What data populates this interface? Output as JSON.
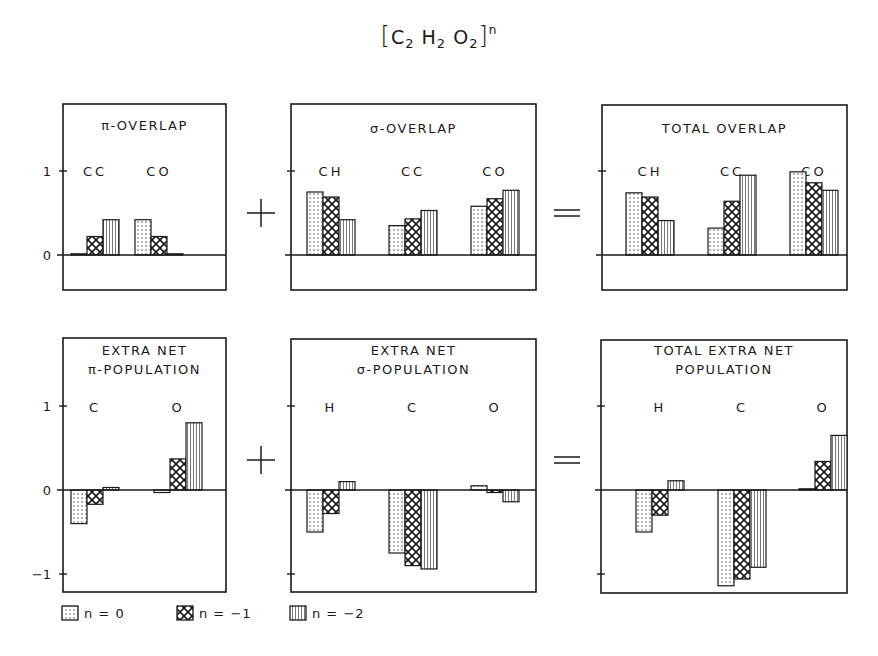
{
  "figure": {
    "title": {
      "open_bracket": "[",
      "parts": [
        {
          "symbol": "C",
          "subscript": "2"
        },
        {
          "symbol": "H",
          "subscript": "2"
        },
        {
          "symbol": "O",
          "subscript": "2"
        }
      ],
      "close_bracket": "]",
      "superscript": "n"
    },
    "operators": {
      "plus": "+",
      "equals": "="
    },
    "colors": {
      "ink": "#1a1a1a",
      "background": "#ffffff"
    }
  },
  "legend": {
    "items": [
      {
        "label": "n = 0",
        "pattern": "dots"
      },
      {
        "label": "n = −1",
        "pattern": "crosshatch"
      },
      {
        "label": "n = −2",
        "pattern": "vertical-lines"
      }
    ]
  },
  "chart_data": [
    {
      "type": "bar",
      "panel": "top-left",
      "title": [
        "π-OVERLAP"
      ],
      "categories": [
        "CC",
        "CO"
      ],
      "series": [
        {
          "name": "n = 0",
          "values": [
            0.01,
            0.42
          ]
        },
        {
          "name": "n = -1",
          "values": [
            0.22,
            0.22
          ]
        },
        {
          "name": "n = -2",
          "values": [
            0.42,
            0.01
          ]
        }
      ],
      "yticks": [
        0,
        1
      ],
      "ytick_labels": [
        "0",
        "1"
      ],
      "ylim": [
        -0.42,
        1.8
      ],
      "xlabel": "",
      "ylabel": "",
      "grid": false
    },
    {
      "type": "bar",
      "panel": "top-middle",
      "title": [
        "σ-OVERLAP"
      ],
      "categories": [
        "CH",
        "CC",
        "CO"
      ],
      "series": [
        {
          "name": "n = 0",
          "values": [
            0.75,
            0.35,
            0.58
          ]
        },
        {
          "name": "n = -1",
          "values": [
            0.69,
            0.43,
            0.67
          ]
        },
        {
          "name": "n = -2",
          "values": [
            0.42,
            0.53,
            0.77
          ]
        }
      ],
      "yticks": [
        0,
        1
      ],
      "ytick_labels": [],
      "ylim": [
        -0.42,
        1.8
      ],
      "xlabel": "",
      "ylabel": "",
      "grid": false
    },
    {
      "type": "bar",
      "panel": "top-right",
      "title": [
        "TOTAL OVERLAP"
      ],
      "categories": [
        "CH",
        "CC",
        "CO"
      ],
      "series": [
        {
          "name": "n = 0",
          "values": [
            0.74,
            0.32,
            0.99
          ]
        },
        {
          "name": "n = -1",
          "values": [
            0.69,
            0.64,
            0.86
          ]
        },
        {
          "name": "n = -2",
          "values": [
            0.41,
            0.95,
            0.77
          ]
        }
      ],
      "yticks": [
        0,
        1
      ],
      "ytick_labels": [],
      "ylim": [
        -0.42,
        1.8
      ],
      "xlabel": "",
      "ylabel": "",
      "grid": false
    },
    {
      "type": "bar",
      "panel": "bottom-left",
      "title": [
        "EXTRA NET",
        "π-POPULATION"
      ],
      "categories": [
        "C",
        "O"
      ],
      "series": [
        {
          "name": "n = 0",
          "values": [
            -0.4,
            -0.03
          ]
        },
        {
          "name": "n = -1",
          "values": [
            -0.17,
            0.37
          ]
        },
        {
          "name": "n = -2",
          "values": [
            0.03,
            0.8
          ]
        }
      ],
      "yticks": [
        -1,
        0,
        1
      ],
      "ytick_labels": [
        "−1",
        "0",
        "1"
      ],
      "ylim": [
        -1.22,
        1.81
      ],
      "xlabel": "",
      "ylabel": "",
      "grid": false
    },
    {
      "type": "bar",
      "panel": "bottom-middle",
      "title": [
        "EXTRA NET",
        "σ-POPULATION"
      ],
      "categories": [
        "H",
        "C",
        "O"
      ],
      "series": [
        {
          "name": "n = 0",
          "values": [
            -0.5,
            -0.75,
            0.05
          ]
        },
        {
          "name": "n = -1",
          "values": [
            -0.28,
            -0.9,
            -0.03
          ]
        },
        {
          "name": "n = -2",
          "values": [
            0.1,
            -0.94,
            -0.14
          ]
        }
      ],
      "yticks": [
        -1,
        0,
        1
      ],
      "ytick_labels": [],
      "ylim": [
        -1.22,
        1.81
      ],
      "xlabel": "",
      "ylabel": "",
      "grid": false
    },
    {
      "type": "bar",
      "panel": "bottom-right",
      "title": [
        "TOTAL EXTRA NET",
        "POPULATION"
      ],
      "categories": [
        "H",
        "C",
        "O"
      ],
      "series": [
        {
          "name": "n = 0",
          "values": [
            -0.5,
            -1.14,
            0.01
          ]
        },
        {
          "name": "n = -1",
          "values": [
            -0.3,
            -1.06,
            0.34
          ]
        },
        {
          "name": "n = -2",
          "values": [
            0.11,
            -0.92,
            0.65
          ]
        }
      ],
      "yticks": [
        -1,
        0,
        1
      ],
      "ytick_labels": [],
      "ylim": [
        -1.22,
        1.81
      ],
      "xlabel": "",
      "ylabel": "",
      "grid": false
    }
  ],
  "layout": {
    "panels": [
      {
        "x": 63,
        "y": 104,
        "w": 163,
        "h": 186,
        "zero_y": 255,
        "unit_px": 84,
        "title_y": [
          130
        ],
        "cat_label_y": 176,
        "cat_centers": [
          95,
          159
        ],
        "bar_width": 16
      },
      {
        "x": 291,
        "y": 104,
        "w": 245,
        "h": 186,
        "zero_y": 255,
        "unit_px": 84,
        "title_y": [
          133
        ],
        "cat_label_y": 176,
        "cat_centers": [
          331,
          413,
          495
        ],
        "bar_width": 16
      },
      {
        "x": 602,
        "y": 105,
        "w": 245,
        "h": 185,
        "zero_y": 255,
        "unit_px": 84,
        "title_y": [
          133
        ],
        "cat_label_y": 176,
        "cat_centers": [
          650,
          732,
          814
        ],
        "bar_width": 16
      },
      {
        "x": 63,
        "y": 338,
        "w": 163,
        "h": 254,
        "zero_y": 490,
        "unit_px": 84,
        "title_y": [
          355,
          374
        ],
        "cat_label_y": 412,
        "cat_centers": [
          95,
          178
        ],
        "bar_width": 16
      },
      {
        "x": 291,
        "y": 339,
        "w": 245,
        "h": 253,
        "zero_y": 490,
        "unit_px": 84,
        "title_y": [
          355,
          374
        ],
        "cat_label_y": 412,
        "cat_centers": [
          331,
          413,
          495
        ],
        "bar_width": 16
      },
      {
        "x": 601,
        "y": 340,
        "w": 246,
        "h": 253,
        "zero_y": 490,
        "unit_px": 84,
        "title_y": [
          355,
          374
        ],
        "cat_label_y": 412,
        "cat_centers": [
          660,
          742,
          823
        ],
        "bar_width": 16
      }
    ],
    "ops": [
      {
        "type": "plus",
        "x": 261,
        "y": 213
      },
      {
        "type": "equals",
        "x": 567,
        "y": 213
      },
      {
        "type": "plus",
        "x": 261,
        "y": 460
      },
      {
        "type": "equals",
        "x": 567,
        "y": 460
      }
    ],
    "legend_pos": [
      {
        "x": 62,
        "y": 613
      },
      {
        "x": 177,
        "y": 613
      },
      {
        "x": 290,
        "y": 613
      }
    ]
  }
}
